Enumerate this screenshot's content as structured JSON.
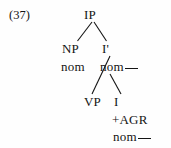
{
  "figure": {
    "example_number": "(37)",
    "caption": "",
    "background_color": "#fefefe",
    "text_color": "#141414",
    "line_color": "#141414"
  },
  "tree": {
    "root_label": "IP",
    "nodes": {
      "ip": "IP",
      "np": "NP",
      "i_bar": "I'",
      "np_feature": "nom",
      "i_bar_feature": "nom",
      "vp": "VP",
      "i": "I",
      "i_agr": "+AGR",
      "i_feature": "nom"
    },
    "blanks": {
      "i_bar_feature_blank": "__",
      "i_feature_blank": "__"
    },
    "edges": [
      {
        "from": "ip",
        "to": "np",
        "style": "diagonal-left"
      },
      {
        "from": "ip",
        "to": "i_bar",
        "style": "diagonal-right"
      },
      {
        "from": "i_bar",
        "to": "vp",
        "style": "diagonal-left-long"
      },
      {
        "from": "i_bar",
        "to": "i",
        "style": "diagonal-right"
      }
    ]
  }
}
